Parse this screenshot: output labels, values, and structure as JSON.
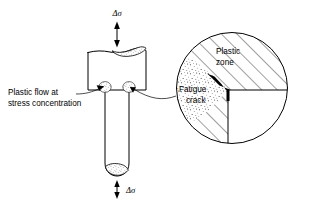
{
  "figure": {
    "background_color": "#ffffff",
    "line_color": "#000000"
  },
  "labels": {
    "stress_top": "Δσ",
    "stress_bottom": "Δσ",
    "plastic_flow_line1": "Plastic flow at",
    "plastic_flow_line2": "stress concentration",
    "plastic_zone_line1": "Plastic",
    "plastic_zone_line2": "zone",
    "fatigue_crack_line1": "Fatigue",
    "fatigue_crack_line2": "crack"
  },
  "specimen": {
    "name": "notched-bar-specimen",
    "head_width_px": 60,
    "head_height_px": 45,
    "shaft_width_px": 24,
    "shaft_length_px": 82,
    "shoulder_y_px": 90
  },
  "detail_circle": {
    "name": "magnified-detail",
    "center_x_px": 232,
    "center_y_px": 88,
    "radius_px": 56,
    "notch_corner_x_px": 228,
    "notch_corner_y_px": 90,
    "hatch_angle_deg": 45,
    "void_quadrant": "lower-right",
    "plastic_zone_texture": "stipple",
    "material_texture": "diagonal-hatch"
  },
  "arrows": {
    "top_arrow": "double-headed-vertical",
    "bottom_arrow": "double-headed-vertical",
    "flow_arrows": "two-angled-arrows-to-shoulders",
    "crack_arrow": "wedge-pointing-left"
  }
}
